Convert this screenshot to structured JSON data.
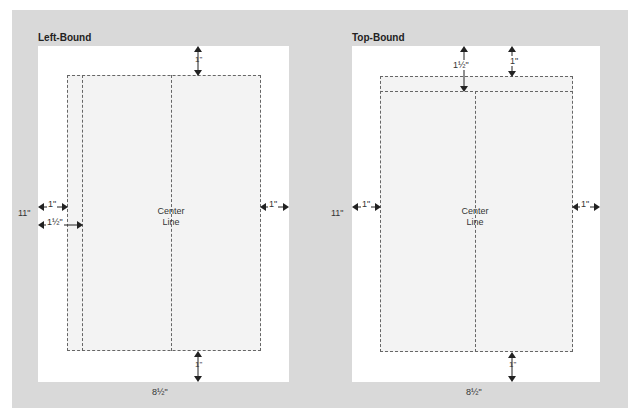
{
  "panels": [
    {
      "id": "left-bound",
      "title": "Left-Bound",
      "center_label_1": "Center",
      "center_label_2": "Line",
      "height_label": "11\"",
      "width_label": "8½\"",
      "top_margin": "1\"",
      "bottom_margin": "1\"",
      "right_margin": "1\"",
      "left_margin": "1\"",
      "binding_margin": "1½\""
    },
    {
      "id": "top-bound",
      "title": "Top-Bound",
      "center_label_1": "Center",
      "center_label_2": "Line",
      "height_label": "11\"",
      "width_label": "8½\"",
      "top_margin": "1\"",
      "binding_margin": "1½\"",
      "bottom_margin": "1\"",
      "left_margin": "1\"",
      "right_margin": "1\""
    }
  ],
  "colors": {
    "background": "#d9d9d9",
    "page": "#ffffff",
    "text_area": "#f3f3f3",
    "dash": "#666666"
  }
}
